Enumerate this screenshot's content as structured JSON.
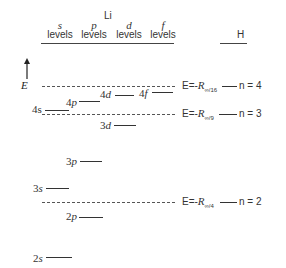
{
  "diagram": {
    "title": "Li",
    "columns": [
      {
        "symbol": "s",
        "label": "levels"
      },
      {
        "symbol": "p",
        "label": "levels"
      },
      {
        "symbol": "d",
        "label": "levels"
      },
      {
        "symbol": "f",
        "label": "levels"
      }
    ],
    "hydrogen_header": "H",
    "axis_label": "E",
    "li_levels": [
      {
        "name": "4s",
        "n": "4",
        "l": "s"
      },
      {
        "name": "4p",
        "n": "4",
        "l": "p"
      },
      {
        "name": "4d",
        "n": "4",
        "l": "d"
      },
      {
        "name": "4f",
        "n": "4",
        "l": "f"
      },
      {
        "name": "3d",
        "n": "3",
        "l": "d"
      },
      {
        "name": "3p",
        "n": "3",
        "l": "p"
      },
      {
        "name": "3s",
        "n": "3",
        "l": "s"
      },
      {
        "name": "2p",
        "n": "2",
        "l": "p"
      },
      {
        "name": "2s",
        "n": "2",
        "l": "s"
      }
    ],
    "h_levels": [
      {
        "energy_prefix": "E=-",
        "R": "R",
        "sub": "∞",
        "denom": "16",
        "n_label": "n = 4"
      },
      {
        "energy_prefix": "E=-",
        "R": "R",
        "sub": "∞",
        "denom": "9",
        "n_label": "n = 3"
      },
      {
        "energy_prefix": "E=-",
        "R": "R",
        "sub": "∞",
        "denom": "4",
        "n_label": "n = 2"
      }
    ]
  }
}
